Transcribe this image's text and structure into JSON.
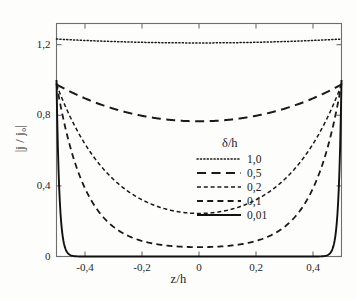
{
  "chart_data": {
    "type": "line",
    "title": "",
    "xlabel": "z/h",
    "ylabel": "|j / j₀|",
    "xlim": [
      -0.5,
      0.5
    ],
    "ylim": [
      0,
      1.32
    ],
    "grid": false,
    "legend_position": "center",
    "legend_title": "δ/h",
    "xticks": [
      -0.4,
      -0.2,
      0,
      0.2,
      0.4
    ],
    "xtick_labels": [
      "-0,4",
      "-0,2",
      "0",
      "0,2",
      "0,4"
    ],
    "yticks": [
      0,
      0.4,
      0.8,
      1.2
    ],
    "ytick_labels": [
      "0",
      "0,4",
      "0,8",
      "1,2"
    ],
    "x": [
      -0.5,
      -0.48,
      -0.46,
      -0.44,
      -0.42,
      -0.4,
      -0.36,
      -0.32,
      -0.28,
      -0.24,
      -0.2,
      -0.16,
      -0.12,
      -0.08,
      -0.04,
      0,
      0.04,
      0.08,
      0.12,
      0.16,
      0.2,
      0.24,
      0.28,
      0.32,
      0.36,
      0.4,
      0.42,
      0.44,
      0.46,
      0.48,
      0.5
    ],
    "series": [
      {
        "name": "1,0",
        "label": "1,0",
        "style": "dotted",
        "delta_over_h": 1.0,
        "color": "#1a1a1a",
        "values": [
          1.232,
          1.229,
          1.227,
          1.225,
          1.223,
          1.221,
          1.218,
          1.216,
          1.214,
          1.213,
          1.212,
          1.211,
          1.211,
          1.21,
          1.21,
          1.21,
          1.21,
          1.21,
          1.211,
          1.211,
          1.212,
          1.213,
          1.214,
          1.216,
          1.218,
          1.221,
          1.223,
          1.225,
          1.227,
          1.229,
          1.232
        ]
      },
      {
        "name": "0,5",
        "label": "0,5",
        "style": "long-dash",
        "delta_over_h": 0.5,
        "color": "#1a1a1a",
        "values": [
          0.975,
          0.935,
          0.906,
          0.884,
          0.867,
          0.853,
          0.831,
          0.815,
          0.802,
          0.791,
          0.783,
          0.776,
          0.771,
          0.768,
          0.766,
          0.766,
          0.766,
          0.768,
          0.771,
          0.776,
          0.783,
          0.791,
          0.802,
          0.815,
          0.831,
          0.853,
          0.867,
          0.884,
          0.906,
          0.935,
          0.975
        ]
      },
      {
        "name": "0,2",
        "label": "0,2",
        "style": "medium-dash",
        "delta_over_h": 0.2,
        "color": "#1a1a1a",
        "values": [
          0.975,
          0.872,
          0.786,
          0.713,
          0.651,
          0.598,
          0.513,
          0.448,
          0.396,
          0.354,
          0.32,
          0.293,
          0.272,
          0.257,
          0.247,
          0.244,
          0.247,
          0.257,
          0.272,
          0.293,
          0.32,
          0.354,
          0.396,
          0.448,
          0.513,
          0.598,
          0.651,
          0.713,
          0.786,
          0.872,
          0.975
        ]
      },
      {
        "name": "0,1",
        "label": "0,1",
        "style": "dash",
        "delta_over_h": 0.1,
        "color": "#1a1a1a",
        "values": [
          0.98,
          0.805,
          0.663,
          0.548,
          0.455,
          0.38,
          0.27,
          0.196,
          0.146,
          0.112,
          0.089,
          0.074,
          0.063,
          0.057,
          0.054,
          0.053,
          0.054,
          0.057,
          0.063,
          0.074,
          0.089,
          0.112,
          0.146,
          0.196,
          0.27,
          0.38,
          0.455,
          0.548,
          0.663,
          0.805,
          0.98
        ]
      },
      {
        "name": "0,01",
        "label": "0,01",
        "style": "solid",
        "delta_over_h": 0.01,
        "color": "#111111",
        "values": [
          1.0,
          0.135,
          0.019,
          0.003,
          0.001,
          0.0,
          0.0,
          0.0,
          0.0,
          0.0,
          0.0,
          0.0,
          0.0,
          0.0,
          0.0,
          0.0,
          0.0,
          0.0,
          0.0,
          0.0,
          0.0,
          0.0,
          0.0,
          0.0,
          0.0,
          0.0,
          0.001,
          0.003,
          0.019,
          0.135,
          1.0
        ]
      }
    ]
  },
  "legend": {
    "title": "δ/h",
    "entries": [
      {
        "label": "1,0"
      },
      {
        "label": "0,5"
      },
      {
        "label": "0,2"
      },
      {
        "label": "0,1"
      },
      {
        "label": "0,01"
      }
    ]
  },
  "axes": {
    "x_title": "z/h",
    "y_title": "|j / j₀|",
    "x_tick_labels": [
      "-0,4",
      "-0,2",
      "0",
      "0,2",
      "0,4"
    ],
    "y_tick_labels": [
      "0",
      "0,4",
      "0,8",
      "1,2"
    ]
  },
  "colors": {
    "line": "#1a1a1a",
    "frame": "#6e6e6e",
    "background": "#fdfdfc"
  }
}
